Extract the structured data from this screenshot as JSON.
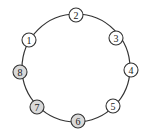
{
  "diagram": {
    "type": "ring",
    "ring": {
      "cx": 76,
      "cy": 68,
      "r": 54
    },
    "node_radius": 7,
    "colors": {
      "unshaded": "#ffffff",
      "shaded": "#d9d9d9",
      "stroke": "#333333"
    },
    "nodes": [
      {
        "label": "1",
        "x": 29,
        "y": 40,
        "shaded": false
      },
      {
        "label": "2",
        "x": 76,
        "y": 15,
        "shaded": false
      },
      {
        "label": "3",
        "x": 116,
        "y": 38,
        "shaded": false
      },
      {
        "label": "4",
        "x": 131,
        "y": 70,
        "shaded": false
      },
      {
        "label": "5",
        "x": 113,
        "y": 106,
        "shaded": false
      },
      {
        "label": "6",
        "x": 78,
        "y": 121,
        "shaded": true
      },
      {
        "label": "7",
        "x": 37,
        "y": 107,
        "shaded": true
      },
      {
        "label": "8",
        "x": 20,
        "y": 72,
        "shaded": true
      }
    ]
  }
}
